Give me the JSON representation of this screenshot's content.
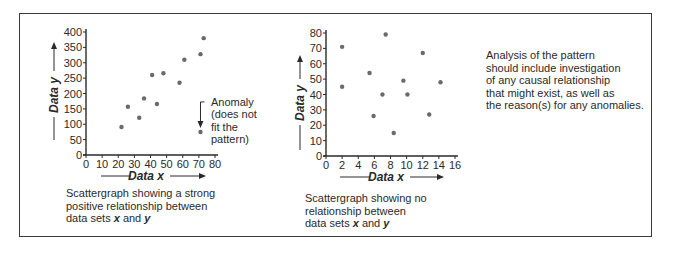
{
  "chart_data": [
    {
      "type": "scatter",
      "title": "Scattergraph showing a strong positive relationship between data sets x and y",
      "xlabel": "Data x",
      "ylabel": "Data y",
      "xlim": [
        0,
        80
      ],
      "ylim": [
        0,
        400
      ],
      "xticks": [
        0,
        10,
        20,
        30,
        40,
        50,
        60,
        70,
        80
      ],
      "yticks": [
        0,
        50,
        100,
        150,
        200,
        250,
        300,
        350,
        400
      ],
      "grid": false,
      "points": [
        {
          "x": 22,
          "y": 91
        },
        {
          "x": 26,
          "y": 157
        },
        {
          "x": 33,
          "y": 121
        },
        {
          "x": 36,
          "y": 184
        },
        {
          "x": 41,
          "y": 260
        },
        {
          "x": 44,
          "y": 166
        },
        {
          "x": 48,
          "y": 266
        },
        {
          "x": 58,
          "y": 235
        },
        {
          "x": 61,
          "y": 310
        },
        {
          "x": 71,
          "y": 328
        },
        {
          "x": 73,
          "y": 380
        },
        {
          "x": 71,
          "y": 75,
          "anomaly": true
        }
      ],
      "annotations": [
        {
          "text": "Anomaly (does not fit the pattern)",
          "target": {
            "x": 71,
            "y": 75
          }
        }
      ]
    },
    {
      "type": "scatter",
      "title": "Scattergraph showing no relationship between data sets x and y",
      "xlabel": "Data x",
      "ylabel": "Data y",
      "xlim": [
        0,
        16
      ],
      "ylim": [
        0,
        80
      ],
      "xticks": [
        0,
        2,
        4,
        6,
        8,
        10,
        12,
        14,
        16
      ],
      "yticks": [
        0,
        10,
        20,
        30,
        40,
        50,
        60,
        70,
        80
      ],
      "grid": false,
      "points": [
        {
          "x": 2,
          "y": 71
        },
        {
          "x": 2,
          "y": 45
        },
        {
          "x": 5.4,
          "y": 54
        },
        {
          "x": 5.9,
          "y": 26
        },
        {
          "x": 7,
          "y": 40
        },
        {
          "x": 7.4,
          "y": 79
        },
        {
          "x": 8.4,
          "y": 15
        },
        {
          "x": 9.6,
          "y": 49
        },
        {
          "x": 10.1,
          "y": 40
        },
        {
          "x": 12,
          "y": 67
        },
        {
          "x": 12.8,
          "y": 27
        },
        {
          "x": 14.2,
          "y": 48
        }
      ]
    }
  ],
  "left_chart": {
    "axis_x_title": "Data x",
    "axis_y_title": "Data y",
    "anomaly_label_lines": [
      "Anomaly",
      "(does not",
      "fit the",
      "pattern)"
    ],
    "caption_line1": "Scattergraph showing a strong",
    "caption_line2": "positive relationship between",
    "caption_line3_pre": "data sets ",
    "caption_var_x": "x",
    "caption_and": " and ",
    "caption_var_y": "y"
  },
  "right_chart": {
    "axis_x_title": "Data x",
    "axis_y_title": "Data y",
    "caption_line1": "Scattergraph showing no",
    "caption_line2": "relationship between",
    "caption_line3_pre": "data sets ",
    "caption_var_x": "x",
    "caption_and": " and ",
    "caption_var_y": "y"
  },
  "analysis_note": {
    "lines": [
      "Analysis of the pattern",
      "should include investigation",
      "of any causal relationship",
      "that might exist, as well as",
      "the reason(s) for any anomalies."
    ]
  },
  "colors": {
    "ink": "#2a2a2a",
    "point": "#6a6a6a",
    "frame": "#3a3a3a"
  }
}
